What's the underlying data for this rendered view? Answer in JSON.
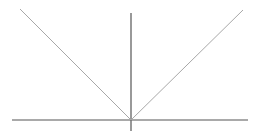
{
  "figure": {
    "name": "absolute-value-ray-diagram",
    "width": 260,
    "height": 135,
    "background_color": "#ffffff",
    "origin": {
      "x": 131,
      "y": 120
    }
  },
  "chart_data": {
    "type": "line",
    "title": "",
    "xlabel": "",
    "ylabel": "",
    "grid": false,
    "legend": null,
    "origin": {
      "x": 131,
      "y": 120
    },
    "axes": [
      {
        "name": "horizontal-axis",
        "orientation": "horizontal",
        "x1": 12,
        "y1": 120,
        "x2": 248,
        "y2": 120,
        "color": "#8c8c8c",
        "width": 1.4
      },
      {
        "name": "vertical-axis",
        "orientation": "vertical",
        "x1": 131,
        "y1": 13,
        "x2": 131,
        "y2": 131,
        "color": "#6e6e6e",
        "width": 1.4
      }
    ],
    "series": [
      {
        "name": "left-ray",
        "x1": 20,
        "y1": 9,
        "x2": 131,
        "y2": 120,
        "color": "#a8a8a8",
        "width": 1.0,
        "slope": -1
      },
      {
        "name": "right-ray",
        "x1": 131,
        "y1": 120,
        "x2": 243,
        "y2": 10,
        "color": "#a8a8a8",
        "width": 1.0,
        "slope": 1
      }
    ]
  }
}
